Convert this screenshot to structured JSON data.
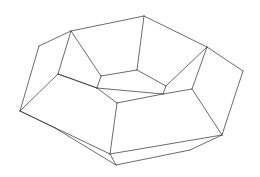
{
  "figure": {
    "type": "wireframe-3d-solid",
    "stroke_color": "#3a3a3a",
    "background": "#ffffff",
    "vertices": {
      "T_outer": [
        144,
        16
      ],
      "TL_outer": [
        71,
        31
      ],
      "L_top": [
        39,
        46
      ],
      "TR_outer": [
        207,
        47
      ],
      "R_far": [
        243,
        71
      ],
      "L_far": [
        20,
        111
      ],
      "R_low": [
        222,
        135
      ],
      "B_front": [
        110,
        154
      ],
      "B_low": [
        116,
        165
      ],
      "BR_low": [
        190,
        150
      ],
      "BL_low": [
        55,
        128
      ],
      "L_mid": [
        58,
        74
      ],
      "R_mid": [
        192,
        89
      ],
      "inner_top": [
        137,
        70
      ],
      "inner_TL": [
        101,
        76
      ],
      "inner_TR": [
        166,
        86
      ],
      "inner_L": [
        97,
        88
      ],
      "inner_R": [
        163,
        94
      ],
      "inner_front": [
        117,
        103
      ]
    },
    "edges": [
      [
        "TL_outer",
        "T_outer"
      ],
      [
        "T_outer",
        "TR_outer"
      ],
      [
        "TR_outer",
        "R_far"
      ],
      [
        "TL_outer",
        "L_top"
      ],
      [
        "L_top",
        "L_far"
      ],
      [
        "R_far",
        "R_low"
      ],
      [
        "L_far",
        "B_front"
      ],
      [
        "L_far",
        "BL_low"
      ],
      [
        "BL_low",
        "B_low"
      ],
      [
        "B_front",
        "B_low"
      ],
      [
        "B_front",
        "R_low"
      ],
      [
        "B_low",
        "BR_low"
      ],
      [
        "BR_low",
        "R_low"
      ],
      [
        "L_far",
        "L_mid"
      ],
      [
        "L_mid",
        "TL_outer"
      ],
      [
        "L_mid",
        "inner_L"
      ],
      [
        "TL_outer",
        "inner_TL"
      ],
      [
        "T_outer",
        "inner_top"
      ],
      [
        "TR_outer",
        "inner_TR"
      ],
      [
        "TR_outer",
        "R_mid"
      ],
      [
        "R_mid",
        "R_low"
      ],
      [
        "R_mid",
        "inner_R"
      ],
      [
        "inner_TL",
        "inner_top"
      ],
      [
        "inner_top",
        "inner_TR"
      ],
      [
        "inner_TL",
        "inner_L"
      ],
      [
        "inner_TR",
        "inner_R"
      ],
      [
        "inner_L",
        "inner_R"
      ],
      [
        "inner_L",
        "inner_front"
      ],
      [
        "inner_front",
        "inner_R"
      ],
      [
        "inner_front",
        "B_front"
      ],
      [
        "inner_L",
        "L_mid"
      ]
    ]
  }
}
